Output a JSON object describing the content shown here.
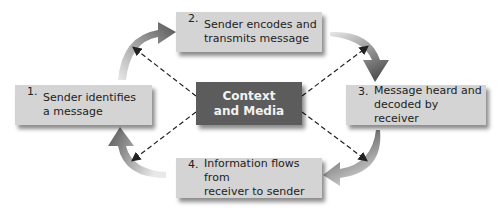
{
  "diagram": {
    "type": "communication-cycle",
    "center": {
      "label": "Context\nand Media",
      "color": "#5c5c5c"
    },
    "steps": [
      {
        "number": "1.",
        "text": "Sender identifies\na message"
      },
      {
        "number": "2.",
        "text": "Sender encodes and\ntransmits message"
      },
      {
        "number": "3.",
        "text": "Message heard and\ndecoded by receiver"
      },
      {
        "number": "4.",
        "text": "Information flows from\nreceiver to sender"
      }
    ],
    "box_color": "#d4d4d4",
    "arrow_color": "#555555",
    "connector_style": "dashed"
  }
}
